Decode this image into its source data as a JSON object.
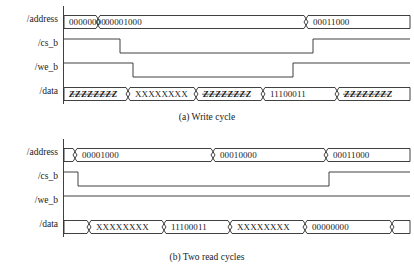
{
  "figure": {
    "signals": [
      "/address",
      "/cs_b",
      "/we_b",
      "/data"
    ],
    "colors": {
      "line": "#1a1a1a",
      "background": "#ffffff",
      "text": "#1a1a1a"
    }
  },
  "panels": [
    {
      "id": "a",
      "caption": "(a) Write cycle",
      "signals": {
        "address": {
          "label": "/address",
          "type": "bus",
          "segments": [
            {
              "value": "00000000",
              "start": 64,
              "end": 98
            },
            {
              "value": "00001000",
              "start": 98,
              "end": 306
            },
            {
              "value": "00011000",
              "start": 306,
              "end": 410
            }
          ]
        },
        "cs_b": {
          "label": "/cs_b",
          "type": "digital",
          "initial": "high",
          "edges": [
            {
              "x": 120,
              "to": "low"
            },
            {
              "x": 313,
              "to": "high"
            }
          ]
        },
        "we_b": {
          "label": "/we_b",
          "type": "digital",
          "initial": "high",
          "edges": [
            {
              "x": 133,
              "to": "low"
            },
            {
              "x": 293,
              "to": "high"
            }
          ]
        },
        "data": {
          "label": "/data",
          "type": "bus",
          "segments": [
            {
              "value": "ZZZZZZZZ",
              "hiz": true,
              "start": 64,
              "end": 128
            },
            {
              "value": "XXXXXXXX",
              "hiz": false,
              "start": 128,
              "end": 196
            },
            {
              "value": "ZZZZZZZZ",
              "hiz": true,
              "start": 196,
              "end": 263
            },
            {
              "value": "11100011",
              "hiz": false,
              "start": 263,
              "end": 337
            },
            {
              "value": "ZZZZZZZZ",
              "hiz": true,
              "start": 337,
              "end": 410
            }
          ]
        }
      }
    },
    {
      "id": "b",
      "caption": "(b) Two read cycles",
      "signals": {
        "address": {
          "label": "/address",
          "type": "bus",
          "segments": [
            {
              "value": "",
              "start": 64,
              "end": 75
            },
            {
              "value": "00001000",
              "start": 75,
              "end": 213
            },
            {
              "value": "00010000",
              "start": 213,
              "end": 326
            },
            {
              "value": "00011000",
              "start": 326,
              "end": 410
            }
          ]
        },
        "cs_b": {
          "label": "/cs_b",
          "type": "digital",
          "initial": "high",
          "edges": [
            {
              "x": 78,
              "to": "low"
            },
            {
              "x": 329,
              "to": "high"
            }
          ]
        },
        "we_b": {
          "label": "/we_b",
          "type": "digital",
          "initial": "high",
          "edges": []
        },
        "data": {
          "label": "/data",
          "type": "bus",
          "segments": [
            {
              "value": "",
              "hiz": false,
              "start": 64,
              "end": 89
            },
            {
              "value": "XXXXXXXX",
              "hiz": false,
              "start": 89,
              "end": 164
            },
            {
              "value": "11100011",
              "hiz": false,
              "start": 164,
              "end": 230
            },
            {
              "value": "XXXXXXXX",
              "hiz": false,
              "start": 230,
              "end": 305
            },
            {
              "value": "00000000",
              "hiz": false,
              "start": 305,
              "end": 392
            },
            {
              "value": "",
              "hiz": false,
              "start": 392,
              "end": 410
            }
          ]
        }
      }
    }
  ]
}
